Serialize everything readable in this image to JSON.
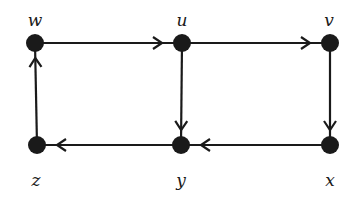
{
  "diagram": {
    "type": "directed-graph",
    "colors": {
      "node": "#1a1a1a",
      "edge": "#1a1a1a",
      "background": "#ffffff"
    },
    "nodes": [
      {
        "id": "w",
        "label": "w",
        "x": 35,
        "y": 43,
        "label_x": 35,
        "label_y": 20
      },
      {
        "id": "u",
        "label": "u",
        "x": 182,
        "y": 43,
        "label_x": 182,
        "label_y": 20
      },
      {
        "id": "v",
        "label": "v",
        "x": 330,
        "y": 43,
        "label_x": 329,
        "label_y": 20
      },
      {
        "id": "z",
        "label": "z",
        "x": 37,
        "y": 145,
        "label_x": 36,
        "label_y": 180
      },
      {
        "id": "y",
        "label": "y",
        "x": 181,
        "y": 145,
        "label_x": 181,
        "label_y": 180
      },
      {
        "id": "x",
        "label": "x",
        "x": 330,
        "y": 145,
        "label_x": 330,
        "label_y": 180
      }
    ],
    "edges": [
      {
        "from": "w",
        "to": "u"
      },
      {
        "from": "u",
        "to": "v"
      },
      {
        "from": "u",
        "to": "y"
      },
      {
        "from": "v",
        "to": "x"
      },
      {
        "from": "x",
        "to": "y"
      },
      {
        "from": "y",
        "to": "z"
      },
      {
        "from": "z",
        "to": "w"
      }
    ]
  }
}
